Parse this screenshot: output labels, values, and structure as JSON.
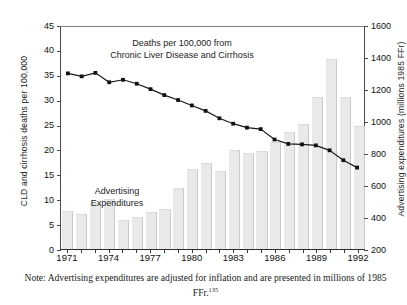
{
  "chart_data": {
    "type": "bar",
    "title": "",
    "subtitle": "",
    "x": [
      1971,
      1972,
      1973,
      1974,
      1975,
      1976,
      1977,
      1978,
      1979,
      1980,
      1981,
      1982,
      1983,
      1984,
      1985,
      1986,
      1987,
      1988,
      1989,
      1990,
      1991,
      1992
    ],
    "categories": [
      "1971",
      "1972",
      "1973",
      "1974",
      "1975",
      "1976",
      "1977",
      "1978",
      "1979",
      "1980",
      "1981",
      "1982",
      "1983",
      "1984",
      "1985",
      "1986",
      "1987",
      "1988",
      "1989",
      "1990",
      "1991",
      "1992"
    ],
    "xlabel": "",
    "grid": false,
    "legend": "none",
    "series": [
      {
        "name": "Advertising Expenditures",
        "type": "bar",
        "axis": "right",
        "unit": "millions 1985 FFr",
        "values": [
          440,
          420,
          490,
          510,
          380,
          400,
          430,
          450,
          580,
          700,
          740,
          690,
          820,
          800,
          810,
          870,
          930,
          980,
          1150,
          1390,
          1150,
          970
        ]
      },
      {
        "name": "Deaths per 100,000 from Chronic Liver Disease and Cirrhosis",
        "type": "line",
        "axis": "left",
        "unit": "deaths per 100,000",
        "marker": "square",
        "values": [
          35.6,
          35.0,
          35.7,
          33.8,
          34.3,
          33.5,
          32.4,
          31.2,
          30.2,
          29.1,
          28.0,
          26.5,
          25.4,
          24.6,
          24.3,
          22.2,
          21.3,
          21.2,
          21.0,
          20.0,
          18.0,
          16.5
        ]
      }
    ],
    "axes": {
      "left": {
        "label": "CLD and cirrhosis deaths per 100,000",
        "ticks": [
          "45",
          "40",
          "35",
          "30",
          "25",
          "20",
          "15",
          "10",
          "5",
          "0"
        ],
        "min": 0,
        "max": 45
      },
      "right": {
        "label": "Advertising expenditures (millions 1985 FFr)",
        "ticks": [
          "1600",
          "1400",
          "1200",
          "1000",
          "800",
          "600",
          "400",
          "200"
        ],
        "min": 200,
        "max": 1600
      },
      "x": {
        "ticks": [
          "1971",
          "1974",
          "1977",
          "1980",
          "1983",
          "1986",
          "1989",
          "1992"
        ],
        "min": 1971,
        "max": 1992
      }
    },
    "annotations": [
      {
        "name": "line-series-label",
        "text": "Deaths per 100,000 from\nChronic Liver Disease and Cirrhosis"
      },
      {
        "name": "bar-series-label",
        "text": "Advertising\nExpenditures"
      }
    ],
    "colors": {
      "bar_fill": "#e9e9e9",
      "bar_edge": "#c9c9c9",
      "line": "#1a1a1a",
      "marker": "#111111",
      "axis": "#3a3a3a",
      "text": "#1a1a1a"
    }
  },
  "note": {
    "text": "Note: Advertising expenditures are adjusted for inflation and are presented in millions of 1985 FFr.",
    "superscript": "135"
  }
}
